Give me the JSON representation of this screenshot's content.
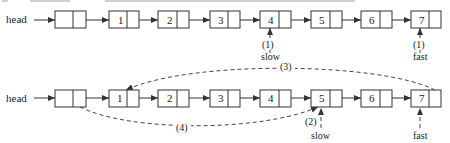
{
  "diagram": {
    "head_label": "head",
    "top_row": {
      "nodes": [
        "",
        "1",
        "2",
        "3",
        "4",
        "5",
        "6",
        "7"
      ],
      "slow_label": "slow",
      "fast_label": "fast",
      "slow_step": "(1)",
      "fast_step": "(1)",
      "slow_at": "4",
      "fast_at": "7"
    },
    "bottom_row": {
      "nodes": [
        "",
        "1",
        "2",
        "3",
        "4",
        "5",
        "6",
        "7"
      ],
      "slow_label": "slow",
      "fast_label": "fast",
      "slow_step": "(2)",
      "slow_at": "5",
      "fast_at": "7",
      "arc_3_label": "(3)",
      "arc_4_label": "(4)"
    }
  }
}
